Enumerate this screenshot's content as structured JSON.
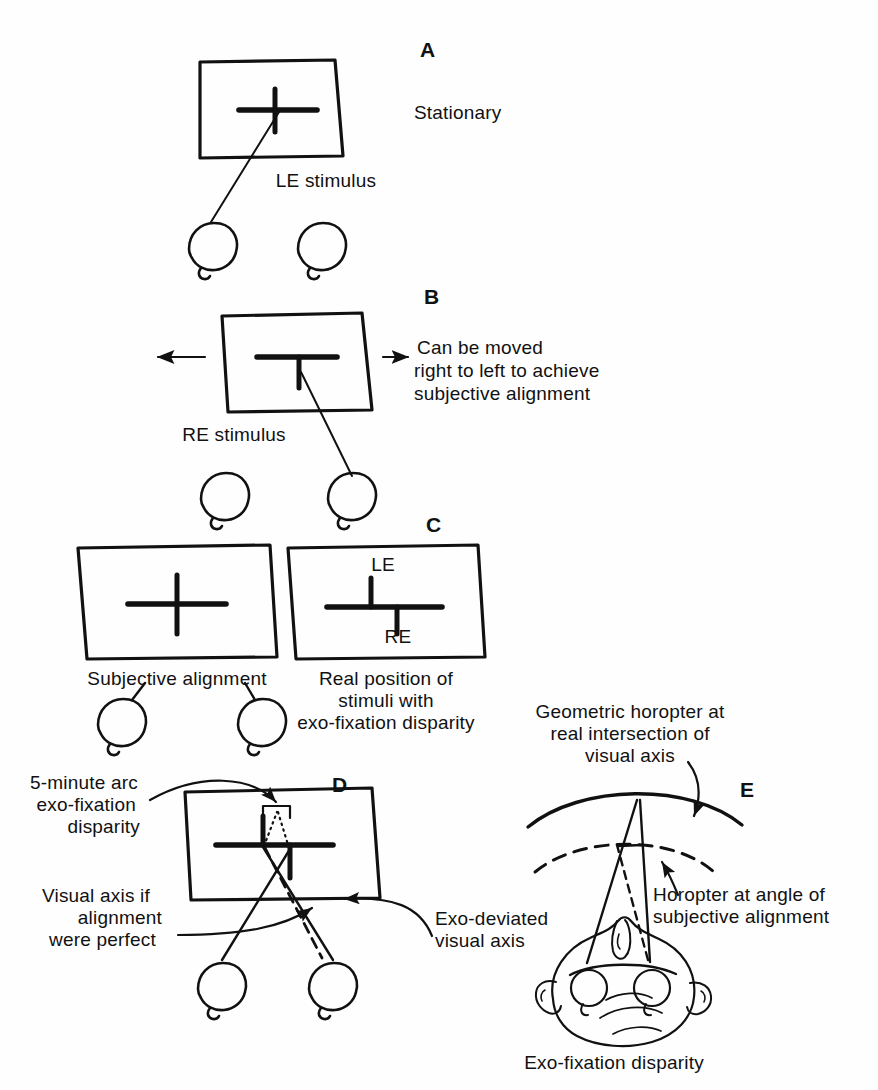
{
  "figure": {
    "background_color": "#fefefe",
    "ink_color": "#111111"
  },
  "panels": [
    {
      "letter": "A",
      "caption": "LE stimulus",
      "note": "Stationary",
      "description": "Left-eye stimulus screen with cross, line of sight to left eye"
    },
    {
      "letter": "B",
      "caption": "RE stimulus",
      "note": "Can be moved\nright to left to achieve\nsubjective alignment",
      "description": "Right-eye stimulus screen with inverted-T, moveable left-right"
    },
    {
      "letter": "C",
      "caption_left": "Subjective alignment",
      "caption_right": "Real position of\nstimuli with\nexo-fixation disparity",
      "marker_le": "LE",
      "marker_re": "RE",
      "description": "Two screens comparing perceived versus real stimulus positions"
    },
    {
      "letter": "D",
      "label_disparity": "5-minute arc\nexo-fixation\ndisparity",
      "label_left_axis": "Visual axis if\nalignment\nwere perfect",
      "label_right_axis": "Exo-deviated\nvisual axis",
      "description": "Screen with both stimuli, crossed visual axes from both eyes"
    },
    {
      "letter": "E",
      "label_top": "Geometric horopter at\nreal intersection of\nvisual axis",
      "label_mid": "Horopter at angle of\nsubjective alignment",
      "caption_bottom": "Exo-fixation disparity",
      "description": "Top-down head view with two horopter arcs"
    }
  ],
  "labels": {
    "a_letter": "A",
    "a_stationary": "Stationary",
    "a_le_stimulus": "LE stimulus",
    "b_letter": "B",
    "b_re_stimulus": "RE stimulus",
    "b_moved_l1": "Can be moved",
    "b_moved_l2": "right to left to achieve",
    "b_moved_l3": "subjective alignment",
    "c_letter": "C",
    "c_subjective_alignment": "Subjective alignment",
    "c_real_l1": "Real position of",
    "c_real_l2": "stimuli with",
    "c_real_l3": "exo-fixation disparity",
    "c_le": "LE",
    "c_re": "RE",
    "d_letter": "D",
    "d_disp_l1": "5-minute arc",
    "d_disp_l2": "exo-fixation",
    "d_disp_l3": "disparity",
    "d_axis_l1": "Visual axis if",
    "d_axis_l2": "alignment",
    "d_axis_l3": "were perfect",
    "d_exo_l1": "Exo-deviated",
    "d_exo_l2": "visual axis",
    "e_letter": "E",
    "e_geo_l1": "Geometric horopter at",
    "e_geo_l2": "real intersection of",
    "e_geo_l3": "visual axis",
    "e_hor_l1": "Horopter at angle of",
    "e_hor_l2": "subjective alignment",
    "e_exo_disparity": "Exo-fixation disparity"
  }
}
